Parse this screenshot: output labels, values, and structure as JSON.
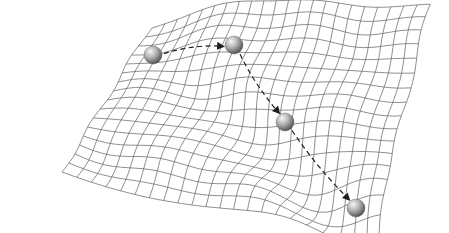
{
  "figure": {
    "background": "#ffffff",
    "mesh_color": "#6a6a6a",
    "arrow_color": "#1e1e1e",
    "ball_color": "#9a9a9a"
  },
  "mesh": {
    "outline": {
      "top_left": [
        62,
        172
      ],
      "top_edge_peak": [
        150,
        20
      ],
      "right_tip": [
        430,
        35
      ],
      "bottom_tip": [
        375,
        225
      ],
      "left_bottom": [
        62,
        172
      ]
    },
    "u_lines": 22,
    "v_lines": 16
  },
  "balls": [
    {
      "id": "ball-1",
      "cx": 153,
      "cy": 55,
      "r": 9
    },
    {
      "id": "ball-2",
      "cx": 234,
      "cy": 45,
      "r": 9
    },
    {
      "id": "ball-3",
      "cx": 285,
      "cy": 122,
      "r": 9
    },
    {
      "id": "ball-4",
      "cx": 356,
      "cy": 208,
      "r": 9
    }
  ],
  "path_arrows": [
    {
      "from": "ball-1",
      "to": "ball-2"
    },
    {
      "from": "ball-2",
      "to": "ball-3"
    },
    {
      "from": "ball-3",
      "to": "ball-4"
    }
  ]
}
